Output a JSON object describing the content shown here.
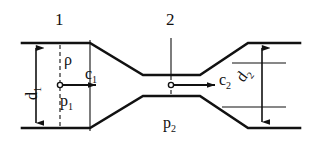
{
  "figure": {
    "type": "venturi-tube-flow-diagram",
    "title": "",
    "line_color": "#111111",
    "background_color": "#ffffff",
    "dashes_color": "#111111"
  },
  "section_labels": [
    {
      "text": "1",
      "name": "section-1-number",
      "x": 55,
      "y": 11
    },
    {
      "text": "2",
      "name": "section-2-number",
      "x": 166,
      "y": 11
    }
  ],
  "dimension_labels": [
    {
      "text": "d",
      "sub": "1",
      "name": "diameter-1-label"
    },
    {
      "text": "d",
      "sub": "2",
      "name": "diameter-2-label"
    }
  ],
  "quantity_labels": [
    {
      "text": "ρ",
      "sub": "",
      "name": "density-rho-label"
    },
    {
      "text": "c",
      "sub": "1",
      "name": "velocity-c1-label"
    },
    {
      "text": "p",
      "sub": "1",
      "name": "pressure-p1-label"
    },
    {
      "text": "c",
      "sub": "2",
      "name": "velocity-c2-label"
    },
    {
      "text": "p",
      "sub": "2",
      "name": "pressure-p2-label"
    }
  ],
  "geometry": {
    "inlet_top_y": 43,
    "inlet_bottom_y": 128,
    "throat_top_y": 75,
    "throat_bottom_y": 96,
    "inlet_left_x": 22,
    "cone_start_x": 90,
    "throat_left_x": 143,
    "throat_right_x": 200,
    "cone_end_x": 248,
    "outlet_right_x": 300,
    "axis_y": 85
  },
  "annotations": {
    "inlet_section_line_x": 90,
    "throat_section_line_x": 171,
    "dim_d1_x": 36,
    "dim_d2_x": 262,
    "center_point_1_x": 60,
    "center_point_2_x": 171,
    "arrow_c1_end_x": 96,
    "arrow_c2_end_x": 215
  }
}
